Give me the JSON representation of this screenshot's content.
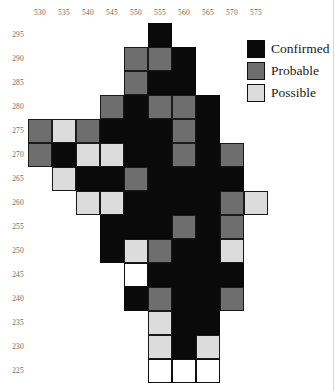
{
  "chart_data": {
    "type": "heatmap",
    "title": "",
    "subtitle": "",
    "xlabel": "",
    "ylabel": "",
    "grid": true,
    "legend_position": "top-right",
    "cell_size": 5,
    "x": [
      530,
      535,
      540,
      545,
      550,
      555,
      560,
      565,
      570,
      575
    ],
    "y": [
      295,
      290,
      285,
      280,
      275,
      270,
      265,
      260,
      255,
      250,
      245,
      240,
      235,
      230,
      225
    ],
    "xlim": [
      528,
      578
    ],
    "ylim": [
      223,
      298
    ],
    "categories": [
      "Confirmed",
      "Probable",
      "Possible"
    ],
    "category_colors": {
      "Confirmed": "#0a0a0a",
      "Probable": "#6e6e6e",
      "Possible": "#dcdcdc",
      "Empty": "#ffffff"
    },
    "legend": [
      {
        "label": "Confirmed",
        "color": "#0a0a0a",
        "key": "confirmed"
      },
      {
        "label": "Probable",
        "color": "#6e6e6e",
        "key": "probable"
      },
      {
        "label": "Possible",
        "color": "#dcdcdc",
        "key": "possible"
      }
    ],
    "cells": [
      {
        "x": 555,
        "y": 295,
        "status": "confirmed"
      },
      {
        "x": 550,
        "y": 290,
        "status": "probable"
      },
      {
        "x": 555,
        "y": 290,
        "status": "probable"
      },
      {
        "x": 560,
        "y": 290,
        "status": "confirmed"
      },
      {
        "x": 550,
        "y": 285,
        "status": "probable"
      },
      {
        "x": 555,
        "y": 285,
        "status": "confirmed"
      },
      {
        "x": 560,
        "y": 285,
        "status": "confirmed"
      },
      {
        "x": 545,
        "y": 280,
        "status": "probable"
      },
      {
        "x": 550,
        "y": 280,
        "status": "confirmed"
      },
      {
        "x": 555,
        "y": 280,
        "status": "probable"
      },
      {
        "x": 560,
        "y": 280,
        "status": "probable"
      },
      {
        "x": 565,
        "y": 280,
        "status": "confirmed"
      },
      {
        "x": 530,
        "y": 275,
        "status": "probable"
      },
      {
        "x": 535,
        "y": 275,
        "status": "possible"
      },
      {
        "x": 540,
        "y": 275,
        "status": "probable"
      },
      {
        "x": 545,
        "y": 275,
        "status": "confirmed"
      },
      {
        "x": 550,
        "y": 275,
        "status": "confirmed"
      },
      {
        "x": 555,
        "y": 275,
        "status": "confirmed"
      },
      {
        "x": 560,
        "y": 275,
        "status": "probable"
      },
      {
        "x": 565,
        "y": 275,
        "status": "confirmed"
      },
      {
        "x": 530,
        "y": 270,
        "status": "probable"
      },
      {
        "x": 535,
        "y": 270,
        "status": "confirmed"
      },
      {
        "x": 540,
        "y": 270,
        "status": "possible"
      },
      {
        "x": 545,
        "y": 270,
        "status": "possible"
      },
      {
        "x": 550,
        "y": 270,
        "status": "confirmed"
      },
      {
        "x": 555,
        "y": 270,
        "status": "confirmed"
      },
      {
        "x": 560,
        "y": 270,
        "status": "probable"
      },
      {
        "x": 565,
        "y": 270,
        "status": "confirmed"
      },
      {
        "x": 570,
        "y": 270,
        "status": "probable"
      },
      {
        "x": 535,
        "y": 265,
        "status": "possible"
      },
      {
        "x": 540,
        "y": 265,
        "status": "confirmed"
      },
      {
        "x": 545,
        "y": 265,
        "status": "confirmed"
      },
      {
        "x": 550,
        "y": 265,
        "status": "probable"
      },
      {
        "x": 555,
        "y": 265,
        "status": "confirmed"
      },
      {
        "x": 560,
        "y": 265,
        "status": "confirmed"
      },
      {
        "x": 565,
        "y": 265,
        "status": "confirmed"
      },
      {
        "x": 570,
        "y": 265,
        "status": "confirmed"
      },
      {
        "x": 540,
        "y": 260,
        "status": "possible"
      },
      {
        "x": 545,
        "y": 260,
        "status": "possible"
      },
      {
        "x": 550,
        "y": 260,
        "status": "confirmed"
      },
      {
        "x": 555,
        "y": 260,
        "status": "confirmed"
      },
      {
        "x": 560,
        "y": 260,
        "status": "confirmed"
      },
      {
        "x": 565,
        "y": 260,
        "status": "confirmed"
      },
      {
        "x": 570,
        "y": 260,
        "status": "probable"
      },
      {
        "x": 575,
        "y": 260,
        "status": "possible"
      },
      {
        "x": 545,
        "y": 255,
        "status": "confirmed"
      },
      {
        "x": 550,
        "y": 255,
        "status": "confirmed"
      },
      {
        "x": 555,
        "y": 255,
        "status": "confirmed"
      },
      {
        "x": 560,
        "y": 255,
        "status": "probable"
      },
      {
        "x": 565,
        "y": 255,
        "status": "confirmed"
      },
      {
        "x": 570,
        "y": 255,
        "status": "probable"
      },
      {
        "x": 545,
        "y": 250,
        "status": "confirmed"
      },
      {
        "x": 550,
        "y": 250,
        "status": "possible"
      },
      {
        "x": 555,
        "y": 250,
        "status": "probable"
      },
      {
        "x": 560,
        "y": 250,
        "status": "confirmed"
      },
      {
        "x": 565,
        "y": 250,
        "status": "confirmed"
      },
      {
        "x": 570,
        "y": 250,
        "status": "possible"
      },
      {
        "x": 550,
        "y": 245,
        "status": "empty"
      },
      {
        "x": 555,
        "y": 245,
        "status": "confirmed"
      },
      {
        "x": 560,
        "y": 245,
        "status": "confirmed"
      },
      {
        "x": 565,
        "y": 245,
        "status": "confirmed"
      },
      {
        "x": 570,
        "y": 245,
        "status": "confirmed"
      },
      {
        "x": 550,
        "y": 240,
        "status": "confirmed"
      },
      {
        "x": 555,
        "y": 240,
        "status": "probable"
      },
      {
        "x": 560,
        "y": 240,
        "status": "confirmed"
      },
      {
        "x": 565,
        "y": 240,
        "status": "confirmed"
      },
      {
        "x": 570,
        "y": 240,
        "status": "probable"
      },
      {
        "x": 555,
        "y": 235,
        "status": "possible"
      },
      {
        "x": 560,
        "y": 235,
        "status": "confirmed"
      },
      {
        "x": 565,
        "y": 235,
        "status": "confirmed"
      },
      {
        "x": 555,
        "y": 230,
        "status": "possible"
      },
      {
        "x": 560,
        "y": 230,
        "status": "confirmed"
      },
      {
        "x": 565,
        "y": 230,
        "status": "possible"
      },
      {
        "x": 555,
        "y": 225,
        "status": "empty"
      },
      {
        "x": 560,
        "y": 225,
        "status": "empty"
      },
      {
        "x": 565,
        "y": 225,
        "status": "empty"
      }
    ]
  },
  "axes": {
    "x_ticks": [
      "530",
      "535",
      "540",
      "545",
      "550",
      "555",
      "560",
      "565",
      "570",
      "575"
    ],
    "y_ticks": [
      "295",
      "290",
      "285",
      "280",
      "275",
      "270",
      "265",
      "260",
      "255",
      "250",
      "245",
      "240",
      "235",
      "230",
      "225"
    ]
  },
  "legend": {
    "confirmed_label": "Confirmed",
    "probable_label": "Probable",
    "possible_label": "Possible"
  }
}
